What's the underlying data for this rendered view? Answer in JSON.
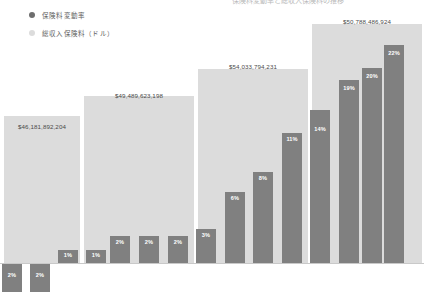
{
  "title": {
    "cropped_text": "保険料変動率と総収入保険料の推移"
  },
  "legend": {
    "position": "top-left",
    "items": [
      {
        "label": "保険料変動率",
        "color": "#6e6e6e",
        "icon": "filled-circle-icon"
      },
      {
        "label": "総収入保険料（ドル）",
        "color": "#dcdcdc",
        "icon": "filled-circle-icon"
      }
    ]
  },
  "colors": {
    "bar": "#808080",
    "band": "#dcdcdc",
    "bar_label": "#ffffff",
    "band_label": "#4a4a4a",
    "background": "#ffffff",
    "baseline": "#c9c9c9"
  },
  "chart_data": {
    "type": "bar",
    "title": "保険料変動率と総収入保険料の推移",
    "xlabel": "",
    "ylabel": "",
    "grid": false,
    "legend_position": "top-left",
    "ylim": [
      -3,
      24
    ],
    "series": [
      {
        "name": "保険料変動率",
        "unit": "%",
        "values": [
          -2,
          -2,
          1,
          1,
          2,
          2,
          2,
          3,
          6,
          8,
          11,
          14,
          19,
          20,
          22,
          18,
          15
        ],
        "labels": [
          "2%",
          "2%",
          "1%",
          "1%",
          "2%",
          "2%",
          "2%",
          "3%",
          "6%",
          "8%",
          "11%",
          "14%",
          "19%",
          "20%",
          "22%",
          "18%",
          "15%"
        ]
      }
    ],
    "bands": [
      {
        "label": "$46,181,892,204",
        "value": 46181892204
      },
      {
        "label": "$49,489,623,198",
        "value": 49489623198
      },
      {
        "label": "$54,033,794,231",
        "value": 54033794231
      },
      {
        "label": "$50,788,486,924",
        "value": 50788486924
      }
    ]
  },
  "geometry": {
    "baseline_y": 263,
    "bands": [
      {
        "x": 4,
        "w": 76,
        "y": 116,
        "label_x": 4,
        "label_w": 76,
        "label_y": 123
      },
      {
        "x": 84,
        "w": 110,
        "y": 96,
        "label_x": 84,
        "label_w": 110,
        "label_y": 92
      },
      {
        "x": 198,
        "w": 110,
        "y": 69,
        "label_x": 198,
        "label_w": 110,
        "label_y": 63
      },
      {
        "x": 312,
        "w": 110,
        "y": 24,
        "label_x": 312,
        "label_w": 110,
        "label_y": 18
      }
    ],
    "bars": [
      {
        "x": 2,
        "w": 20,
        "top": 264,
        "h": 28,
        "label_y": 272,
        "negative": true
      },
      {
        "x": 30,
        "w": 20,
        "top": 264,
        "h": 28,
        "label_y": 272,
        "negative": true
      },
      {
        "x": 58,
        "w": 20,
        "top": 250,
        "h": 13,
        "label_y": 252,
        "negative": false
      },
      {
        "x": 86,
        "w": 20,
        "top": 250,
        "h": 13,
        "label_y": 252,
        "negative": false
      },
      {
        "x": 110,
        "w": 20,
        "top": 236,
        "h": 27,
        "label_y": 239,
        "negative": false
      },
      {
        "x": 139,
        "w": 20,
        "top": 236,
        "h": 27,
        "label_y": 239,
        "negative": false
      },
      {
        "x": 168,
        "w": 20,
        "top": 236,
        "h": 27,
        "label_y": 239,
        "negative": false
      },
      {
        "x": 196,
        "w": 20,
        "top": 229,
        "h": 34,
        "label_y": 232,
        "negative": false
      },
      {
        "x": 225,
        "w": 20,
        "top": 192,
        "h": 71,
        "label_y": 195,
        "negative": false
      },
      {
        "x": 253,
        "w": 20,
        "top": 172,
        "h": 91,
        "label_y": 175,
        "negative": false
      },
      {
        "x": 282,
        "w": 20,
        "top": 133,
        "h": 130,
        "label_y": 136,
        "negative": false
      },
      {
        "x": 310,
        "w": 20,
        "top": 110,
        "h": 153,
        "label_y": 126,
        "negative": false
      },
      {
        "x": 339,
        "w": 20,
        "top": 80,
        "h": 183,
        "label_y": 85,
        "negative": false
      },
      {
        "x": 362,
        "w": 20,
        "top": 68,
        "h": 195,
        "label_y": 73,
        "negative": false
      },
      {
        "x": 384,
        "w": 20,
        "top": 45,
        "h": 218,
        "label_y": 50,
        "negative": false
      }
    ]
  }
}
